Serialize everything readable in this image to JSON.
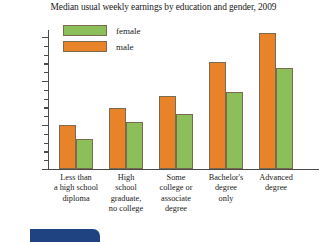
{
  "chart_data": {
    "type": "bar",
    "title": "Median usual weekly earnings by education and gender, 2009",
    "xlabel": "",
    "ylabel": "",
    "ylim": [
      0,
      1600
    ],
    "grid": false,
    "legend_position": "top-left",
    "categories": [
      "Less than a high school diploma",
      "High school graduate, no college",
      "Some college or associate degree",
      "Bachelor's degree only",
      "Advanced degree"
    ],
    "category_lines": [
      [
        "Less than",
        "a high school",
        "diploma"
      ],
      [
        "High",
        "school",
        "graduate,",
        "no college"
      ],
      [
        "Some",
        "college or",
        "associate",
        "degree"
      ],
      [
        "Bachelor's",
        "degree",
        "only"
      ],
      [
        "Advanced",
        "degree"
      ]
    ],
    "series": [
      {
        "name": "male",
        "color": "#E8832A",
        "values": [
          500,
          700,
          830,
          1225,
          1555
        ]
      },
      {
        "name": "female",
        "color": "#8CBF5A",
        "values": [
          350,
          540,
          635,
          885,
          1150
        ]
      }
    ],
    "y_ticks_major": [
      0,
      500,
      1000,
      1500
    ],
    "y_tick_labels": [
      "$0",
      "$500",
      "$1000",
      "$1500"
    ],
    "y_tick_minor_step": 100
  },
  "legend": {
    "items": [
      {
        "label": "female",
        "color": "#8CBF5A"
      },
      {
        "label": "male",
        "color": "#E8832A"
      }
    ]
  },
  "decoration": {
    "tab_color": "#1F4380"
  }
}
